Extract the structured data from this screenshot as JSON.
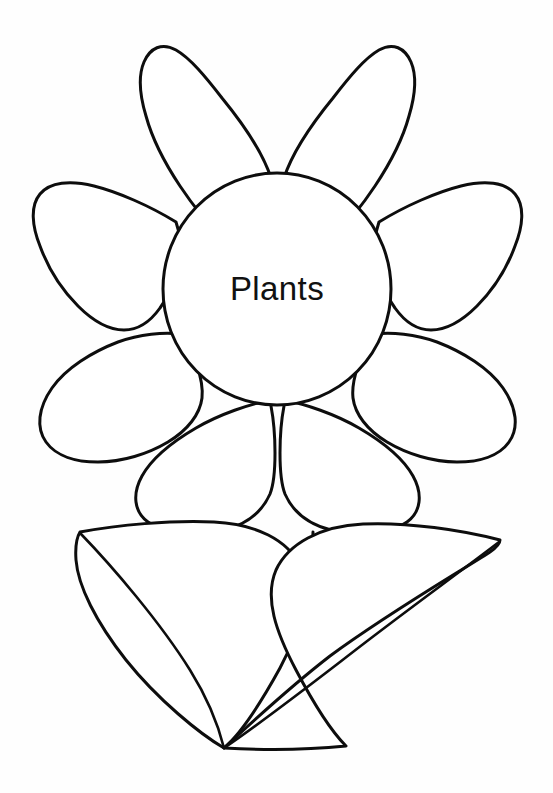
{
  "page": {
    "title": "Plants",
    "background_color": "#fefefe",
    "line_color": "#0d0d0d",
    "fill_color": "#ffffff",
    "width": 553,
    "height": 793
  },
  "flower": {
    "center": {
      "label": "Plants",
      "cx": 277,
      "cy": 289,
      "rx": 114,
      "ry": 116,
      "font_size": 33,
      "text_color": "#111111"
    },
    "petals": [
      {
        "name": "petal-top-left",
        "label": ""
      },
      {
        "name": "petal-top-right",
        "label": ""
      },
      {
        "name": "petal-upper-left",
        "label": ""
      },
      {
        "name": "petal-upper-right",
        "label": ""
      },
      {
        "name": "petal-lower-left",
        "label": ""
      },
      {
        "name": "petal-lower-right",
        "label": ""
      },
      {
        "name": "petal-bottom-left",
        "label": ""
      },
      {
        "name": "petal-bottom-right",
        "label": ""
      }
    ],
    "petal_count": 8,
    "stem": {
      "left_line": "M 235 528 L 236 560",
      "right_line": "M 313 532 L 312 566"
    },
    "leaves": [
      {
        "name": "leaf-left",
        "tip_x": 80,
        "tip_y": 532,
        "base_x": 224,
        "base_y": 748
      },
      {
        "name": "leaf-right",
        "tip_x": 500,
        "tip_y": 540,
        "base_x": 224,
        "base_y": 748
      }
    ],
    "leaf_count": 2
  }
}
